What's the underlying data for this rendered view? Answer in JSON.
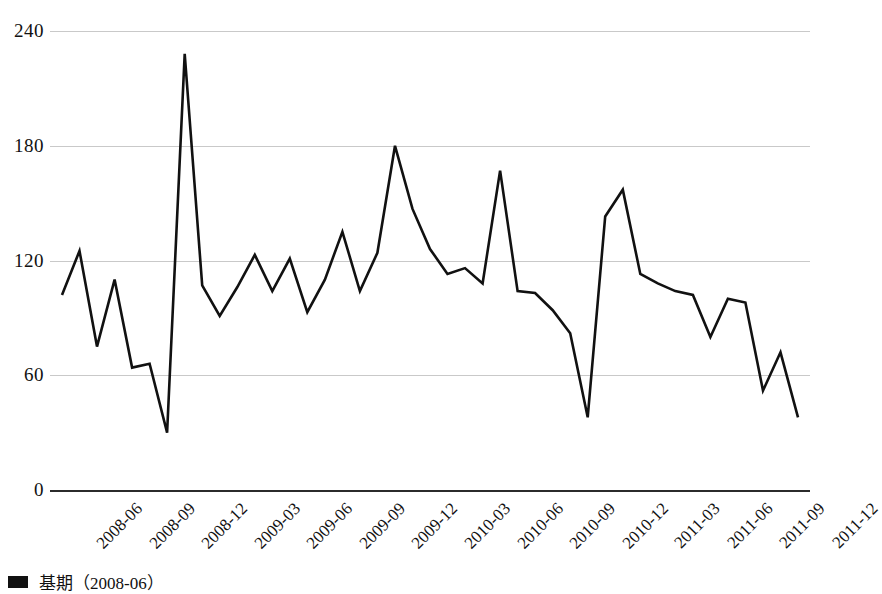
{
  "chart_data": {
    "type": "line",
    "title": "",
    "xlabel": "",
    "ylabel": "",
    "ylim": [
      0,
      240
    ],
    "yticks": [
      0,
      60,
      120,
      180,
      240
    ],
    "ytick_labels": [
      "0",
      "60",
      "120",
      "180",
      "240"
    ],
    "grid": true,
    "legend_position": "bottom-left",
    "legend": [
      "基期（2008-06）"
    ],
    "x": [
      "2008-06",
      "2008-07",
      "2008-08",
      "2008-09",
      "2008-10",
      "2008-11",
      "2008-12",
      "2009-01",
      "2009-02",
      "2009-03",
      "2009-04",
      "2009-05",
      "2009-06",
      "2009-07",
      "2009-08",
      "2009-09",
      "2009-10",
      "2009-11",
      "2009-12",
      "2010-01",
      "2010-02",
      "2010-03",
      "2010-04",
      "2010-05",
      "2010-06",
      "2010-07",
      "2010-08",
      "2010-09",
      "2010-10",
      "2010-11",
      "2010-12",
      "2011-01",
      "2011-02",
      "2011-03",
      "2011-04",
      "2011-05",
      "2011-06",
      "2011-07",
      "2011-08",
      "2011-09",
      "2011-10",
      "2011-11",
      "2011-12"
    ],
    "xtick_labels": [
      "2008-06",
      "2008-09",
      "2008-12",
      "2009-03",
      "2009-06",
      "2009-09",
      "2009-12",
      "2010-03",
      "2010-06",
      "2010-09",
      "2010-12",
      "2011-03",
      "2011-06",
      "2011-09",
      "2011-12"
    ],
    "series": [
      {
        "name": "基期（2008-06）",
        "color": "#111111",
        "values": [
          102,
          125,
          75,
          110,
          64,
          66,
          30,
          228,
          107,
          91,
          106,
          123,
          104,
          121,
          93,
          110,
          135,
          104,
          124,
          180,
          147,
          126,
          113,
          116,
          108,
          167,
          104,
          103,
          94,
          82,
          38,
          143,
          157,
          113,
          108,
          104,
          102,
          80,
          100,
          98,
          52,
          72,
          38
        ]
      }
    ]
  },
  "legend": {
    "label": "基期（2008-06）",
    "swatch_color": "#111111"
  },
  "axis": {
    "baseline_color": "#2b2b2b",
    "gridline_color": "#c9c9c9"
  }
}
